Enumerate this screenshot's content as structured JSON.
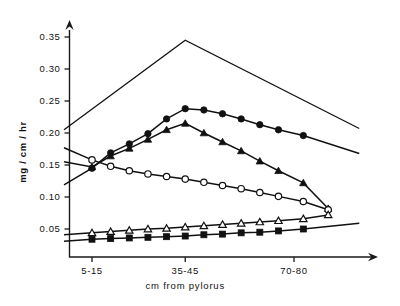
{
  "chart_data": {
    "type": "line",
    "title": "",
    "xlabel": "cm from pylorus",
    "ylabel": "mg / cm / hr",
    "xtick_labels": [
      "5-15",
      "35-45",
      "70-80"
    ],
    "xtick_values": [
      10,
      40,
      75
    ],
    "ytick_labels": [
      "0.05",
      "0.10",
      "0.15",
      "0.20",
      "0.25",
      "0.30",
      "0.35"
    ],
    "ytick_values": [
      0.05,
      0.1,
      0.15,
      0.2,
      0.25,
      0.3,
      0.35
    ],
    "ylim": [
      0,
      0.375
    ],
    "xlim": [
      1,
      96
    ],
    "grid": false,
    "legend_position": "none",
    "series": [
      {
        "name": "top-envelope",
        "marker": "none",
        "x": [
          1,
          40,
          96
        ],
        "y": [
          0.205,
          0.345,
          0.207
        ]
      },
      {
        "name": "filled-circle",
        "marker": "filled-circle",
        "x": [
          1,
          10,
          16,
          22,
          28,
          34,
          40,
          46,
          52,
          58,
          64,
          70,
          78,
          96
        ],
        "y": [
          0.119,
          0.145,
          0.169,
          0.183,
          0.199,
          0.222,
          0.238,
          0.236,
          0.23,
          0.222,
          0.213,
          0.205,
          0.196,
          0.168
        ]
      },
      {
        "name": "filled-triangle",
        "marker": "filled-triangle",
        "x": [
          1,
          10,
          16,
          22,
          28,
          34,
          40,
          46,
          52,
          58,
          64,
          70,
          78,
          86
        ],
        "y": [
          0.155,
          0.147,
          0.164,
          0.176,
          0.19,
          0.205,
          0.215,
          0.2,
          0.186,
          0.172,
          0.156,
          0.141,
          0.122,
          0.082
        ]
      },
      {
        "name": "open-circle",
        "marker": "open-circle",
        "x": [
          1,
          10,
          16,
          22,
          28,
          34,
          40,
          46,
          52,
          58,
          64,
          70,
          78,
          86
        ],
        "y": [
          0.177,
          0.158,
          0.148,
          0.141,
          0.136,
          0.132,
          0.128,
          0.123,
          0.118,
          0.113,
          0.107,
          0.101,
          0.093,
          0.08
        ]
      },
      {
        "name": "open-triangle",
        "marker": "open-triangle",
        "x": [
          1,
          10,
          16,
          22,
          28,
          34,
          40,
          46,
          52,
          58,
          64,
          70,
          78,
          86
        ],
        "y": [
          0.041,
          0.044,
          0.046,
          0.048,
          0.05,
          0.051,
          0.053,
          0.055,
          0.057,
          0.059,
          0.061,
          0.063,
          0.066,
          0.072
        ]
      },
      {
        "name": "filled-square",
        "marker": "filled-square",
        "x": [
          1,
          10,
          16,
          22,
          28,
          34,
          40,
          46,
          52,
          58,
          64,
          70,
          78,
          96
        ],
        "y": [
          0.031,
          0.034,
          0.035,
          0.036,
          0.037,
          0.038,
          0.039,
          0.041,
          0.042,
          0.044,
          0.045,
          0.047,
          0.05,
          0.059
        ]
      }
    ]
  },
  "colors": {
    "ink": "#111111",
    "paper": "#ffffff"
  }
}
